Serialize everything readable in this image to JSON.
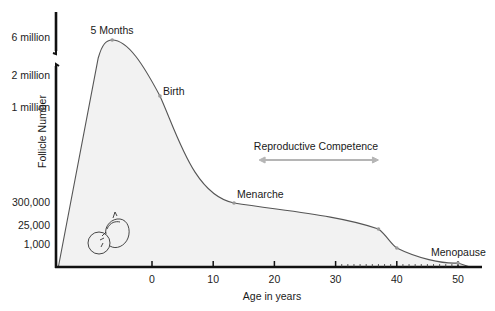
{
  "chart_data": {
    "type": "area",
    "title": "",
    "xlabel": "Age in years",
    "ylabel": "Follicle Number",
    "x_ticks": [
      0,
      10,
      20,
      30,
      40,
      50
    ],
    "xlim": [
      -15.5,
      52.5
    ],
    "y_ticks": [
      {
        "label": "6 million",
        "level": 7
      },
      {
        "label": "2 million",
        "level": 6
      },
      {
        "label": "1 million",
        "level": 5
      },
      {
        "label": "300,000",
        "level": 3
      },
      {
        "label": "25,000",
        "level": 2
      },
      {
        "label": "1,000",
        "level": 1
      }
    ],
    "y_axis_break": "between 2 million and 6 million",
    "y_scale": "non-linear (categorical levels)",
    "grid": false,
    "series": [
      {
        "name": "Follicle Number",
        "points": [
          {
            "x": -15.3,
            "y": 0,
            "label": ""
          },
          {
            "x": -6.5,
            "y": 6000000,
            "label": "5 Months"
          },
          {
            "x": 1.3,
            "y": 1200000,
            "label": "Birth"
          },
          {
            "x": 13.4,
            "y": 300000,
            "label": "Menarche"
          },
          {
            "x": 37.0,
            "y": 25000,
            "label": ""
          },
          {
            "x": 40.0,
            "y": 1000,
            "label": ""
          },
          {
            "x": 50.0,
            "y": 0,
            "label": "Menopause"
          }
        ]
      }
    ],
    "annotations": [
      {
        "text": "5 Months",
        "x": -6.5
      },
      {
        "text": "Birth",
        "x": 1.3
      },
      {
        "text": "Menarche",
        "x": 13.4
      },
      {
        "text": "Menopause",
        "x": 50
      },
      {
        "text": "Reproductive Competence",
        "x_range": [
          17.5,
          37
        ],
        "type": "double-arrow"
      }
    ],
    "decorations": [
      "fetus-illustration"
    ],
    "colors": {
      "line": "#555555",
      "fill": "#f2f2f2",
      "axis": "#111111",
      "marker": "#9a9a9a",
      "arrow": "#b5b5b5"
    }
  }
}
